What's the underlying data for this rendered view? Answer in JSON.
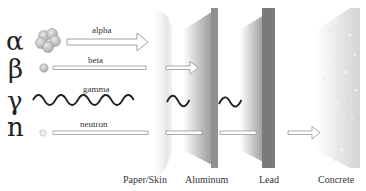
{
  "particles": [
    {
      "symbol": "α",
      "label": "alpha",
      "stopped_by": "Paper/Skin"
    },
    {
      "symbol": "β",
      "label": "beta",
      "stopped_by": "Aluminum"
    },
    {
      "symbol": "γ",
      "label": "gamma",
      "stopped_by": "Lead"
    },
    {
      "symbol": "n",
      "label": "neutron",
      "stopped_by": "Concrete"
    }
  ],
  "materials": [
    {
      "label": "Paper/Skin"
    },
    {
      "label": "Aluminum"
    },
    {
      "label": "Lead"
    },
    {
      "label": "Concrete"
    }
  ],
  "colors": {
    "track_outline": "#8a8a8a",
    "wave": "#222222",
    "particle_fill": "#c8c8c8",
    "aluminum": "#8d8d8d",
    "lead": "#6f6f6f",
    "concrete": "#d9d9d9"
  }
}
